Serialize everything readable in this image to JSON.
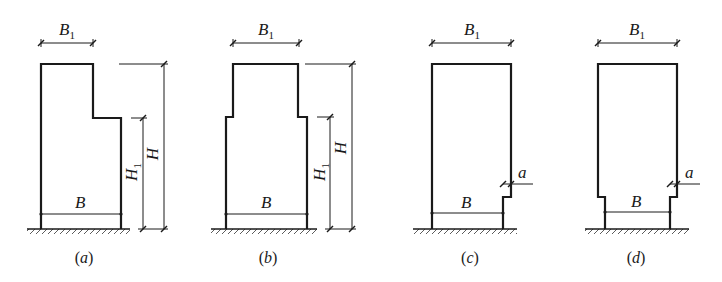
{
  "figure": {
    "panels": [
      {
        "id": "a",
        "caption_open": "(",
        "caption_letter": "a",
        "caption_close": ")",
        "top_width_label": "B",
        "top_width_sub": "1",
        "base_width_label": "B",
        "total_height_label": "H",
        "partial_height_label": "H",
        "partial_height_sub": "1"
      },
      {
        "id": "b",
        "caption_open": "(",
        "caption_letter": "b",
        "caption_close": ")",
        "top_width_label": "B",
        "top_width_sub": "1",
        "base_width_label": "B",
        "total_height_label": "H",
        "partial_height_label": "H",
        "partial_height_sub": "1"
      },
      {
        "id": "c",
        "caption_open": "(",
        "caption_letter": "c",
        "caption_close": ")",
        "top_width_label": "B",
        "top_width_sub": "1",
        "base_width_label": "B",
        "offset_label": "a"
      },
      {
        "id": "d",
        "caption_open": "(",
        "caption_letter": "d",
        "caption_close": ")",
        "top_width_label": "B",
        "top_width_sub": "1",
        "base_width_label": "B",
        "offset_label": "a"
      }
    ]
  }
}
